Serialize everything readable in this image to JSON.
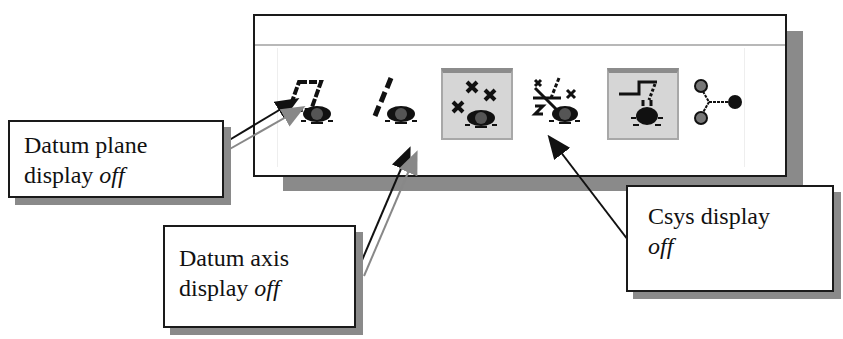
{
  "toolbar": {
    "buttons": [
      {
        "id": "datum-plane-display",
        "icon": "datum-plane-eye-icon",
        "state": "off"
      },
      {
        "id": "datum-axis-display",
        "icon": "datum-axis-eye-icon",
        "state": "off"
      },
      {
        "id": "datum-point-display",
        "icon": "datum-point-eye-icon",
        "state": "on"
      },
      {
        "id": "csys-display",
        "icon": "csys-eye-icon",
        "state": "off"
      },
      {
        "id": "annotation-display",
        "icon": "annotation-eye-icon",
        "state": "on"
      },
      {
        "id": "network-display",
        "icon": "network-nodes-icon",
        "state": "off"
      }
    ]
  },
  "callouts": {
    "datum_plane": {
      "line1": "Datum plane",
      "line2_prefix": "display ",
      "line2_italic": "off"
    },
    "datum_axis": {
      "line1": "Datum axis",
      "line2_prefix": "display ",
      "line2_italic": "off"
    },
    "csys": {
      "line1": "Csys display",
      "line2_prefix": "",
      "line2_italic": "off"
    }
  },
  "colors": {
    "pressed_bg": "#d6d6d6",
    "shadow": "#8a8a8a",
    "border": "#1a1a1a"
  }
}
